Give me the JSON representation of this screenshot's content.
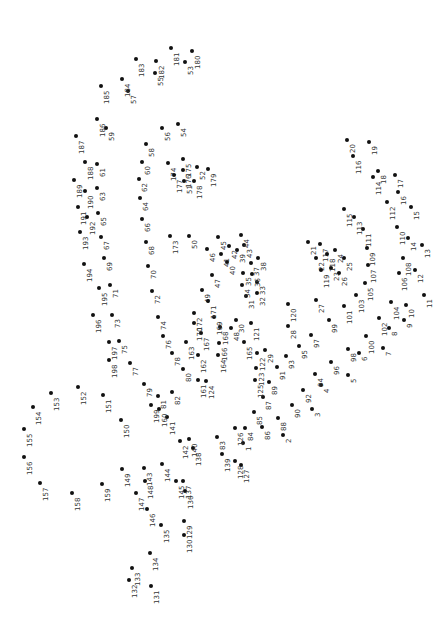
{
  "puzzle": {
    "type": "connect-the-dots",
    "orientation": "rotated-90",
    "dot_color": "#111111",
    "label_color": "#333333",
    "dots": [
      {
        "n": "1",
        "x": 243,
        "y": 443
      },
      {
        "n": "2",
        "x": 283,
        "y": 435
      },
      {
        "n": "3",
        "x": 312,
        "y": 409
      },
      {
        "n": "4",
        "x": 321,
        "y": 385
      },
      {
        "n": "5",
        "x": 348,
        "y": 375
      },
      {
        "n": "6",
        "x": 359,
        "y": 353
      },
      {
        "n": "7",
        "x": 383,
        "y": 348
      },
      {
        "n": "8",
        "x": 389,
        "y": 328
      },
      {
        "n": "9",
        "x": 404,
        "y": 320
      },
      {
        "n": "10",
        "x": 406,
        "y": 305
      },
      {
        "n": "11",
        "x": 424,
        "y": 295
      },
      {
        "n": "12",
        "x": 415,
        "y": 270
      },
      {
        "n": "13",
        "x": 422,
        "y": 245
      },
      {
        "n": "14",
        "x": 408,
        "y": 238
      },
      {
        "n": "15",
        "x": 411,
        "y": 207
      },
      {
        "n": "16",
        "x": 398,
        "y": 192
      },
      {
        "n": "17",
        "x": 395,
        "y": 175
      },
      {
        "n": "18",
        "x": 378,
        "y": 171
      },
      {
        "n": "19",
        "x": 369,
        "y": 142
      },
      {
        "n": "20",
        "x": 347,
        "y": 140
      },
      {
        "n": "21",
        "x": 308,
        "y": 242
      },
      {
        "n": "22",
        "x": 316,
        "y": 258
      },
      {
        "n": "23",
        "x": 331,
        "y": 268
      },
      {
        "n": "24",
        "x": 335,
        "y": 250
      },
      {
        "n": "25",
        "x": 344,
        "y": 258
      },
      {
        "n": "26",
        "x": 339,
        "y": 273
      },
      {
        "n": "27",
        "x": 316,
        "y": 300
      },
      {
        "n": "28",
        "x": 288,
        "y": 326
      },
      {
        "n": "29",
        "x": 265,
        "y": 350
      },
      {
        "n": "30",
        "x": 236,
        "y": 320
      },
      {
        "n": "31",
        "x": 246,
        "y": 296
      },
      {
        "n": "32",
        "x": 257,
        "y": 293
      },
      {
        "n": "33",
        "x": 257,
        "y": 282
      },
      {
        "n": "34",
        "x": 242,
        "y": 285
      },
      {
        "n": "35",
        "x": 243,
        "y": 273
      },
      {
        "n": "36",
        "x": 252,
        "y": 274
      },
      {
        "n": "37",
        "x": 251,
        "y": 263
      },
      {
        "n": "38",
        "x": 258,
        "y": 258
      },
      {
        "n": "39",
        "x": 237,
        "y": 250
      },
      {
        "n": "40",
        "x": 227,
        "y": 262
      },
      {
        "n": "41",
        "x": 221,
        "y": 254
      },
      {
        "n": "42",
        "x": 229,
        "y": 246
      },
      {
        "n": "43",
        "x": 244,
        "y": 245
      },
      {
        "n": "44",
        "x": 241,
        "y": 235
      },
      {
        "n": "45",
        "x": 218,
        "y": 237
      },
      {
        "n": "46",
        "x": 207,
        "y": 249
      },
      {
        "n": "47",
        "x": 212,
        "y": 275
      },
      {
        "n": "48",
        "x": 231,
        "y": 328
      },
      {
        "n": "49",
        "x": 202,
        "y": 290
      },
      {
        "n": "50",
        "x": 189,
        "y": 236
      },
      {
        "n": "51",
        "x": 184,
        "y": 181
      },
      {
        "n": "52",
        "x": 197,
        "y": 167
      },
      {
        "n": "53",
        "x": 185,
        "y": 62
      },
      {
        "n": "54",
        "x": 178,
        "y": 124
      },
      {
        "n": "55",
        "x": 155,
        "y": 73
      },
      {
        "n": "56",
        "x": 162,
        "y": 128
      },
      {
        "n": "57",
        "x": 128,
        "y": 91
      },
      {
        "n": "58",
        "x": 146,
        "y": 144
      },
      {
        "n": "59",
        "x": 106,
        "y": 128
      },
      {
        "n": "60",
        "x": 142,
        "y": 162
      },
      {
        "n": "61",
        "x": 97,
        "y": 164
      },
      {
        "n": "62",
        "x": 139,
        "y": 179
      },
      {
        "n": "63",
        "x": 97,
        "y": 188
      },
      {
        "n": "64",
        "x": 140,
        "y": 198
      },
      {
        "n": "65",
        "x": 98,
        "y": 213
      },
      {
        "n": "66",
        "x": 142,
        "y": 219
      },
      {
        "n": "67",
        "x": 101,
        "y": 237
      },
      {
        "n": "68",
        "x": 146,
        "y": 242
      },
      {
        "n": "69",
        "x": 104,
        "y": 258
      },
      {
        "n": "70",
        "x": 148,
        "y": 266
      },
      {
        "n": "71",
        "x": 110,
        "y": 285
      },
      {
        "n": "72",
        "x": 152,
        "y": 291
      },
      {
        "n": "73",
        "x": 112,
        "y": 315
      },
      {
        "n": "74",
        "x": 158,
        "y": 317
      },
      {
        "n": "75",
        "x": 119,
        "y": 341
      },
      {
        "n": "76",
        "x": 163,
        "y": 336
      },
      {
        "n": "77",
        "x": 130,
        "y": 363
      },
      {
        "n": "78",
        "x": 172,
        "y": 353
      },
      {
        "n": "79",
        "x": 144,
        "y": 384
      },
      {
        "n": "80",
        "x": 183,
        "y": 369
      },
      {
        "n": "81",
        "x": 158,
        "y": 396
      },
      {
        "n": "82",
        "x": 172,
        "y": 392
      },
      {
        "n": "83",
        "x": 217,
        "y": 437
      },
      {
        "n": "84",
        "x": 245,
        "y": 428
      },
      {
        "n": "85",
        "x": 254,
        "y": 412
      },
      {
        "n": "86",
        "x": 262,
        "y": 427
      },
      {
        "n": "87",
        "x": 263,
        "y": 397
      },
      {
        "n": "88",
        "x": 278,
        "y": 418
      },
      {
        "n": "89",
        "x": 269,
        "y": 382
      },
      {
        "n": "90",
        "x": 292,
        "y": 405
      },
      {
        "n": "91",
        "x": 277,
        "y": 367
      },
      {
        "n": "92",
        "x": 303,
        "y": 390
      },
      {
        "n": "93",
        "x": 286,
        "y": 356
      },
      {
        "n": "94",
        "x": 315,
        "y": 374
      },
      {
        "n": "95",
        "x": 299,
        "y": 346
      },
      {
        "n": "96",
        "x": 331,
        "y": 362
      },
      {
        "n": "97",
        "x": 311,
        "y": 335
      },
      {
        "n": "98",
        "x": 348,
        "y": 349
      },
      {
        "n": "99",
        "x": 329,
        "y": 320
      },
      {
        "n": "100",
        "x": 366,
        "y": 336
      },
      {
        "n": "101",
        "x": 344,
        "y": 306
      },
      {
        "n": "102",
        "x": 379,
        "y": 318
      },
      {
        "n": "103",
        "x": 356,
        "y": 295
      },
      {
        "n": "104",
        "x": 391,
        "y": 302
      },
      {
        "n": "105",
        "x": 365,
        "y": 283
      },
      {
        "n": "106",
        "x": 399,
        "y": 273
      },
      {
        "n": "107",
        "x": 368,
        "y": 265
      },
      {
        "n": "108",
        "x": 403,
        "y": 258
      },
      {
        "n": "109",
        "x": 367,
        "y": 248
      },
      {
        "n": "110",
        "x": 397,
        "y": 227
      },
      {
        "n": "111",
        "x": 363,
        "y": 229
      },
      {
        "n": "112",
        "x": 387,
        "y": 202
      },
      {
        "n": "113",
        "x": 354,
        "y": 217
      },
      {
        "n": "114",
        "x": 373,
        "y": 177
      },
      {
        "n": "115",
        "x": 344,
        "y": 209
      },
      {
        "n": "116",
        "x": 353,
        "y": 156
      },
      {
        "n": "117",
        "x": 320,
        "y": 244
      },
      {
        "n": "118",
        "x": 327,
        "y": 254
      },
      {
        "n": "119",
        "x": 321,
        "y": 270
      },
      {
        "n": "120",
        "x": 288,
        "y": 304
      },
      {
        "n": "121",
        "x": 251,
        "y": 323
      },
      {
        "n": "122",
        "x": 257,
        "y": 353
      },
      {
        "n": "123",
        "x": 256,
        "y": 368
      },
      {
        "n": "124",
        "x": 206,
        "y": 381
      },
      {
        "n": "125",
        "x": 255,
        "y": 380
      },
      {
        "n": "126",
        "x": 235,
        "y": 428
      },
      {
        "n": "127",
        "x": 241,
        "y": 465
      },
      {
        "n": "128",
        "x": 235,
        "y": 461
      },
      {
        "n": "129",
        "x": 184,
        "y": 521
      },
      {
        "n": "130",
        "x": 184,
        "y": 535
      },
      {
        "n": "131",
        "x": 151,
        "y": 586
      },
      {
        "n": "132",
        "x": 129,
        "y": 580
      },
      {
        "n": "133",
        "x": 132,
        "y": 568
      },
      {
        "n": "134",
        "x": 150,
        "y": 553
      },
      {
        "n": "135",
        "x": 161,
        "y": 525
      },
      {
        "n": "136",
        "x": 185,
        "y": 491
      },
      {
        "n": "137",
        "x": 183,
        "y": 481
      },
      {
        "n": "138",
        "x": 193,
        "y": 448
      },
      {
        "n": "139",
        "x": 222,
        "y": 454
      },
      {
        "n": "140",
        "x": 189,
        "y": 439
      },
      {
        "n": "141",
        "x": 167,
        "y": 417
      },
      {
        "n": "142",
        "x": 180,
        "y": 441
      },
      {
        "n": "143",
        "x": 144,
        "y": 468
      },
      {
        "n": "144",
        "x": 162,
        "y": 464
      },
      {
        "n": "145",
        "x": 176,
        "y": 481
      },
      {
        "n": "146",
        "x": 147,
        "y": 509
      },
      {
        "n": "147",
        "x": 136,
        "y": 493
      },
      {
        "n": "148",
        "x": 145,
        "y": 481
      },
      {
        "n": "149",
        "x": 122,
        "y": 469
      },
      {
        "n": "150",
        "x": 121,
        "y": 420
      },
      {
        "n": "151",
        "x": 103,
        "y": 395
      },
      {
        "n": "152",
        "x": 78,
        "y": 387
      },
      {
        "n": "153",
        "x": 51,
        "y": 393
      },
      {
        "n": "154",
        "x": 33,
        "y": 407
      },
      {
        "n": "155",
        "x": 24,
        "y": 429
      },
      {
        "n": "156",
        "x": 24,
        "y": 457
      },
      {
        "n": "157",
        "x": 40,
        "y": 483
      },
      {
        "n": "158",
        "x": 72,
        "y": 493
      },
      {
        "n": "159",
        "x": 102,
        "y": 484
      },
      {
        "n": "160",
        "x": 159,
        "y": 409
      },
      {
        "n": "161",
        "x": 198,
        "y": 380
      },
      {
        "n": "162",
        "x": 198,
        "y": 355
      },
      {
        "n": "163",
        "x": 186,
        "y": 342
      },
      {
        "n": "164",
        "x": 218,
        "y": 355
      },
      {
        "n": "165",
        "x": 244,
        "y": 342
      },
      {
        "n": "166",
        "x": 219,
        "y": 343
      },
      {
        "n": "167",
        "x": 201,
        "y": 333
      },
      {
        "n": "168",
        "x": 220,
        "y": 327
      },
      {
        "n": "169",
        "x": 214,
        "y": 317
      },
      {
        "n": "170",
        "x": 194,
        "y": 323
      },
      {
        "n": "171",
        "x": 208,
        "y": 301
      },
      {
        "n": "172",
        "x": 194,
        "y": 313
      },
      {
        "n": "173",
        "x": 170,
        "y": 236
      },
      {
        "n": "174",
        "x": 168,
        "y": 163
      },
      {
        "n": "175",
        "x": 183,
        "y": 159
      },
      {
        "n": "176",
        "x": 183,
        "y": 170
      },
      {
        "n": "177",
        "x": 174,
        "y": 175
      },
      {
        "n": "178",
        "x": 194,
        "y": 181
      },
      {
        "n": "179",
        "x": 208,
        "y": 169
      },
      {
        "n": "180",
        "x": 192,
        "y": 51
      },
      {
        "n": "181",
        "x": 171,
        "y": 48
      },
      {
        "n": "182",
        "x": 156,
        "y": 61
      },
      {
        "n": "183",
        "x": 136,
        "y": 59
      },
      {
        "n": "184",
        "x": 122,
        "y": 79
      },
      {
        "n": "185",
        "x": 101,
        "y": 86
      },
      {
        "n": "186",
        "x": 97,
        "y": 119
      },
      {
        "n": "187",
        "x": 76,
        "y": 136
      },
      {
        "n": "188",
        "x": 85,
        "y": 162
      },
      {
        "n": "189",
        "x": 74,
        "y": 180
      },
      {
        "n": "190",
        "x": 85,
        "y": 191
      },
      {
        "n": "191",
        "x": 78,
        "y": 207
      },
      {
        "n": "192",
        "x": 87,
        "y": 217
      },
      {
        "n": "193",
        "x": 80,
        "y": 232
      },
      {
        "n": "194",
        "x": 84,
        "y": 264
      },
      {
        "n": "195",
        "x": 99,
        "y": 288
      },
      {
        "n": "196",
        "x": 93,
        "y": 315
      },
      {
        "n": "197",
        "x": 109,
        "y": 342
      },
      {
        "n": "198",
        "x": 109,
        "y": 360
      },
      {
        "n": "199",
        "x": 151,
        "y": 405
      }
    ]
  }
}
